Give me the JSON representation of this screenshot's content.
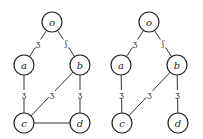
{
  "graphs": [
    {
      "name": "left-graph",
      "nodes": [
        {
          "id": "o",
          "label": "o",
          "x": 52,
          "y": 22
        },
        {
          "id": "a",
          "label": "a",
          "x": 24,
          "y": 65
        },
        {
          "id": "b",
          "label": "b",
          "x": 80,
          "y": 65
        },
        {
          "id": "c",
          "label": "c",
          "x": 24,
          "y": 123
        },
        {
          "id": "d",
          "label": "d",
          "x": 80,
          "y": 123
        }
      ],
      "edges": [
        {
          "from": "o",
          "to": "a",
          "mark": "ʒ"
        },
        {
          "from": "o",
          "to": "b",
          "mark": "ʃ"
        },
        {
          "from": "a",
          "to": "c",
          "mark": "ʒ"
        },
        {
          "from": "b",
          "to": "c",
          "mark": "ʒ"
        },
        {
          "from": "b",
          "to": "d",
          "mark": "ʒ"
        },
        {
          "from": "c",
          "to": "d",
          "mark": ""
        }
      ]
    },
    {
      "name": "right-graph",
      "nodes": [
        {
          "id": "o",
          "label": "o",
          "x": 149,
          "y": 22
        },
        {
          "id": "a",
          "label": "a",
          "x": 121,
          "y": 65
        },
        {
          "id": "b",
          "label": "b",
          "x": 177,
          "y": 65
        },
        {
          "id": "c",
          "label": "c",
          "x": 122,
          "y": 123
        },
        {
          "id": "d",
          "label": "d",
          "x": 178,
          "y": 123
        }
      ],
      "edges": [
        {
          "from": "o",
          "to": "a",
          "mark": "ʒ"
        },
        {
          "from": "o",
          "to": "b",
          "mark": "ʃ"
        },
        {
          "from": "a",
          "to": "c",
          "mark": "ʒ"
        },
        {
          "from": "b",
          "to": "c",
          "mark": "ʒ"
        },
        {
          "from": "b",
          "to": "d",
          "mark": "ʒ"
        }
      ]
    }
  ],
  "node_radius": 10
}
